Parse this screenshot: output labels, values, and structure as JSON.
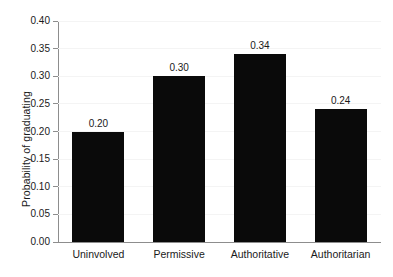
{
  "chart_data": {
    "type": "bar",
    "title": "",
    "subtitle": "",
    "xlabel": "",
    "ylabel": "Probability of graduating",
    "categories": [
      "Uninvolved",
      "Permissive",
      "Authoritative",
      "Authoritarian"
    ],
    "values": [
      0.2,
      0.3,
      0.34,
      0.24
    ],
    "value_labels": [
      "0.20",
      "0.30",
      "0.34",
      "0.24"
    ],
    "ylim": [
      0.0,
      0.4
    ],
    "ytick_values": [
      0.0,
      0.05,
      0.1,
      0.15,
      0.2,
      0.25,
      0.3,
      0.35,
      0.4
    ],
    "ytick_labels": [
      "0.00",
      "0.05",
      "0.10",
      "0.15",
      "0.20",
      "0.25",
      "0.30",
      "0.35",
      "0.40"
    ],
    "grid": "faint-horizontal",
    "legend": "none",
    "bar_color": "#0a0a0a",
    "axis_color": "#8d8d8d",
    "background_color": "#ffffff"
  }
}
